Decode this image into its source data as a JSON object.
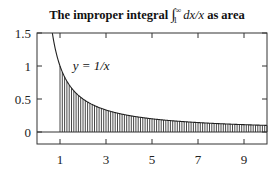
{
  "chart_data": {
    "type": "area",
    "title_parts": {
      "prefix": "The improper integral ",
      "integral": "∫",
      "lower": "1",
      "upper": "∞",
      "integrand": "dx/x",
      "suffix": " as area"
    },
    "xlabel": "",
    "ylabel": "",
    "xlim": [
      0,
      10
    ],
    "ylim": [
      -0.18,
      1.5
    ],
    "x_ticks": [
      1,
      3,
      5,
      7,
      9
    ],
    "x_tick_labels": [
      "1",
      "3",
      "5",
      "7",
      "9"
    ],
    "y_ticks": [
      0,
      0.5,
      1,
      1.5
    ],
    "y_tick_labels": [
      "0",
      "0.5",
      "1",
      "1.5"
    ],
    "grid": false,
    "legend": null,
    "series": [
      {
        "name": "y = 1/x",
        "function": "1/x",
        "x": [
          0.667,
          1,
          1.5,
          2,
          3,
          4,
          5,
          6,
          7,
          8,
          9,
          10
        ],
        "values": [
          1.5,
          1.0,
          0.667,
          0.5,
          0.333,
          0.25,
          0.2,
          0.167,
          0.143,
          0.125,
          0.111,
          0.1
        ]
      }
    ],
    "shaded_region": {
      "from_x": 1,
      "to_x": 10,
      "under": "y = 1/x",
      "style": "vertical hatching",
      "hatch_step": 0.1
    },
    "annotations": [
      {
        "text": "y = 1/x",
        "x": 1.55,
        "y": 1.0
      }
    ],
    "zero_line": true
  },
  "colors": {
    "axis": "#333333",
    "curve": "#222222",
    "hatch": "#333333",
    "background": "#ffffff"
  }
}
